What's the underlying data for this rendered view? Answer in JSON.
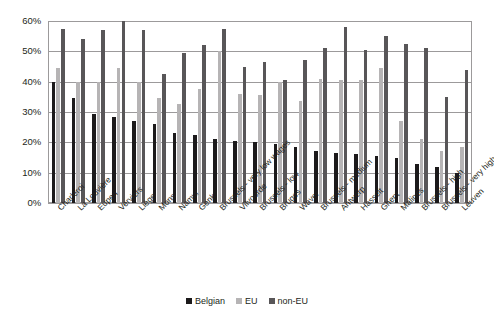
{
  "chart_data": {
    "type": "bar",
    "title": "",
    "subtitle": "",
    "xlabel": "",
    "ylabel": "",
    "ylim": [
      0,
      60
    ],
    "yticks": [
      "0%",
      "10%",
      "20%",
      "30%",
      "40%",
      "50%",
      "60%"
    ],
    "ytick_values": [
      0,
      10,
      20,
      30,
      40,
      50,
      60
    ],
    "grid": true,
    "legend_position": "bottom-center",
    "categories": [
      "Charleroi",
      "La Louvière",
      "Eupen",
      "Verviers",
      "Liège",
      "Mons",
      "Namur",
      "Genk",
      "Brussels - very low wages",
      "Vilvoorde",
      "Brussels - low",
      "Bruges",
      "Waver",
      "Brussels - medium",
      "Antwerp",
      "Hasselt",
      "Ghent",
      "Malines",
      "Brussels - high",
      "Brussels - very high",
      "Leuven"
    ],
    "series": [
      {
        "name": "Belgian",
        "color": "#1c1a1b",
        "values": [
          40.0,
          34.5,
          29.5,
          28.5,
          27.0,
          26.0,
          23.0,
          22.5,
          21.0,
          20.5,
          20.0,
          19.5,
          18.5,
          17.0,
          16.5,
          16.0,
          15.5,
          15.0,
          13.0,
          12.0,
          10.0
        ]
      },
      {
        "name": "EU",
        "color": "#b6b4b5",
        "values": [
          44.5,
          40.0,
          40.0,
          44.5,
          40.0,
          34.5,
          32.5,
          37.5,
          50.0,
          36.0,
          35.5,
          40.0,
          33.5,
          41.0,
          40.5,
          40.5,
          44.5,
          27.0,
          21.0,
          17.0,
          18.5
        ]
      },
      {
        "name": "non-EU",
        "color": "#585658",
        "values": [
          57.5,
          54.0,
          57.0,
          60.0,
          57.0,
          42.5,
          49.5,
          52.0,
          57.5,
          45.0,
          46.5,
          40.5,
          47.0,
          51.0,
          58.0,
          50.5,
          55.0,
          52.5,
          51.0,
          35.0,
          44.0
        ]
      }
    ]
  },
  "legend": {
    "items": [
      {
        "label": "Belgian"
      },
      {
        "label": "EU"
      },
      {
        "label": "non-EU"
      }
    ]
  }
}
